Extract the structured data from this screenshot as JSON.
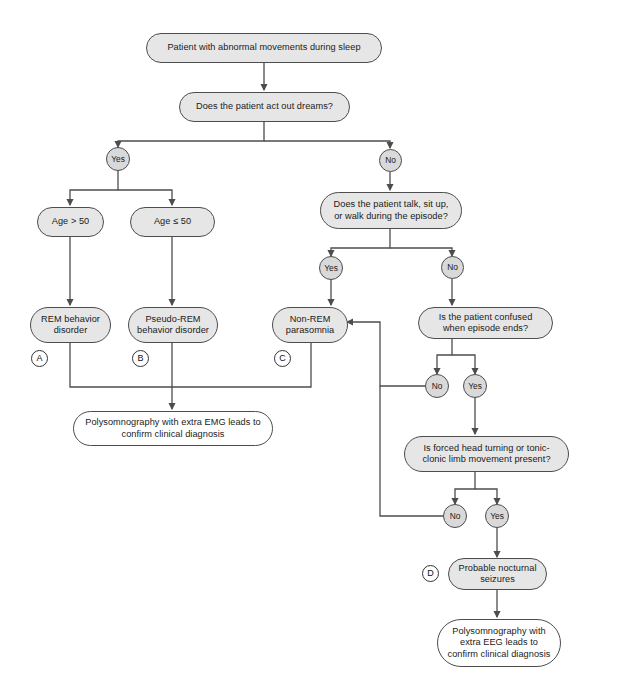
{
  "diagram": {
    "stroke_color": "#4d4d4d",
    "node_fill": "#e6e6e6",
    "plain_fill": "#ffffff",
    "decision_fill": "#d9d9d9"
  },
  "nodes": {
    "start": {
      "label": "Patient with abnormal movements during sleep"
    },
    "q_act_out_dreams": {
      "label": "Does the patient act out dreams?"
    },
    "age_over_50": {
      "label": "Age > 50"
    },
    "age_under_50": {
      "label": "Age ≤ 50"
    },
    "rem_behavior_disorder": {
      "label": "REM behavior disorder"
    },
    "pseudo_rem_behavior_disorder": {
      "label": "Pseudo-REM behavior disorder"
    },
    "non_rem_parasomnia": {
      "label": "Non-REM parasomnia"
    },
    "psg_emg": {
      "label": "Polysomnography with extra EMG leads to confirm clinical diagnosis"
    },
    "q_talk_sit_walk": {
      "label": "Does the patient talk, sit up, or walk during the episode?"
    },
    "q_confused": {
      "label": "Is the patient confused when episode ends?"
    },
    "q_head_turning": {
      "label": "Is forced head turning or tonic-clonic limb movement present?"
    },
    "probable_nocturnal_seizures": {
      "label": "Probable nocturnal seizures"
    },
    "psg_eeg": {
      "label": "Polysomnography with extra EEG leads to confirm clinical diagnosis"
    }
  },
  "decisions": {
    "dreams_yes": {
      "label": "Yes"
    },
    "dreams_no": {
      "label": "No"
    },
    "talk_yes": {
      "label": "Yes"
    },
    "talk_no": {
      "label": "No"
    },
    "confused_no": {
      "label": "No"
    },
    "confused_yes": {
      "label": "Yes"
    },
    "head_no": {
      "label": "No"
    },
    "head_yes": {
      "label": "Yes"
    }
  },
  "tags": {
    "a": {
      "label": "A"
    },
    "b": {
      "label": "B"
    },
    "c": {
      "label": "C"
    },
    "d": {
      "label": "D"
    }
  }
}
